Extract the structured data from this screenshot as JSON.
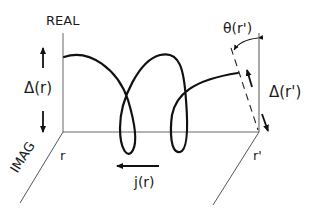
{
  "diagram": {
    "labels": {
      "real_axis": "REAL",
      "imag_axis": "IMAG",
      "delta_r": "Δ(r)",
      "delta_r_prime": "Δ(r')",
      "theta_r_prime": "θ(r')",
      "r": "r",
      "r_prime": "r'",
      "current": "j(r)"
    },
    "colors": {
      "stroke": "#111111",
      "axis": "#555555",
      "background": "#ffffff"
    }
  }
}
